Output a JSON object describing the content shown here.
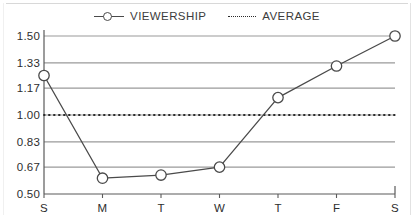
{
  "chart_data": {
    "type": "line",
    "title": "",
    "xlabel": "",
    "ylabel": "",
    "categories": [
      "S",
      "M",
      "T",
      "W",
      "T",
      "F",
      "S"
    ],
    "ylim": [
      0.5,
      1.5
    ],
    "ytick_labels": [
      "1.50",
      "1.33",
      "1.17",
      "1.00",
      "0.83",
      "0.67",
      "0.50"
    ],
    "ytick_values": [
      1.5,
      1.33,
      1.17,
      1.0,
      0.83,
      0.67,
      0.5
    ],
    "grid": true,
    "legend_position": "top-center",
    "series": [
      {
        "name": "VIEWERSHIP",
        "type": "line",
        "marker": "open-circle",
        "color": "#4a4a4a",
        "values": [
          1.25,
          0.6,
          0.62,
          0.67,
          1.11,
          1.31,
          1.5
        ]
      },
      {
        "name": "AVERAGE",
        "type": "constant-line",
        "style": "dotted",
        "color": "#2b2b2b",
        "value": 1.0,
        "values": [
          1.0,
          1.0,
          1.0,
          1.0,
          1.0,
          1.0,
          1.0
        ]
      }
    ]
  },
  "legend": {
    "items": [
      {
        "label": "VIEWERSHIP",
        "marker": "line-circle-marker"
      },
      {
        "label": "AVERAGE",
        "marker": "dotted-line-marker"
      }
    ]
  },
  "colors": {
    "series_line": "#4a4a4a",
    "average_line": "#2b2b2b",
    "gridline": "#9a9a9a",
    "axis": "#5a5a5a",
    "text": "#2d2d2d",
    "background": "#ffffff"
  }
}
